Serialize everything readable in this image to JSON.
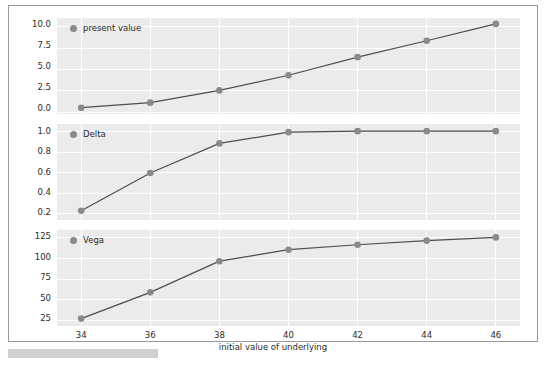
{
  "figure": {
    "xlabel": "initial value of underlying",
    "background": "#ebebeb",
    "grid_color": "#ffffff",
    "marker_color": "#8a8a8a",
    "line_color": "#4d4d4d"
  },
  "chart_data": [
    {
      "type": "line",
      "title": "",
      "legend": "present value",
      "legend_position": "top-left",
      "xlabel": "",
      "ylabel": "",
      "x": [
        34,
        36,
        38,
        40,
        42,
        44,
        46
      ],
      "values": [
        0.15,
        0.75,
        2.2,
        4.0,
        6.15,
        8.1,
        10.1
      ],
      "yticks": [
        "0.0",
        "2.5",
        "5.0",
        "7.5",
        "10.0"
      ],
      "ytick_values": [
        0.0,
        2.5,
        5.0,
        7.5,
        10.0
      ],
      "ylim": [
        -0.6,
        10.8
      ],
      "xlim": [
        33.3,
        46.7
      ],
      "grid": true
    },
    {
      "type": "line",
      "title": "",
      "legend": "Delta",
      "legend_position": "top-left",
      "xlabel": "",
      "ylabel": "",
      "x": [
        34,
        36,
        38,
        40,
        42,
        44,
        46
      ],
      "values": [
        0.22,
        0.59,
        0.88,
        0.99,
        1.0,
        1.0,
        1.0
      ],
      "yticks": [
        "0.2",
        "0.4",
        "0.6",
        "0.8",
        "1.0"
      ],
      "ytick_values": [
        0.2,
        0.4,
        0.6,
        0.8,
        1.0
      ],
      "ylim": [
        0.13,
        1.07
      ],
      "xlim": [
        33.3,
        46.7
      ],
      "grid": true
    },
    {
      "type": "line",
      "title": "",
      "legend": "Vega",
      "legend_position": "top-left",
      "xlabel": "initial value of underlying",
      "ylabel": "",
      "x": [
        34,
        36,
        38,
        40,
        42,
        44,
        46
      ],
      "values": [
        25,
        57,
        95,
        109,
        115,
        120,
        124
      ],
      "yticks": [
        "25",
        "50",
        "75",
        "100",
        "125"
      ],
      "ytick_values": [
        25,
        50,
        75,
        100,
        125
      ],
      "ylim": [
        16,
        133
      ],
      "xlim": [
        33.3,
        46.7
      ],
      "xticks": [
        "34",
        "36",
        "38",
        "40",
        "42",
        "44",
        "46"
      ],
      "grid": true
    }
  ]
}
